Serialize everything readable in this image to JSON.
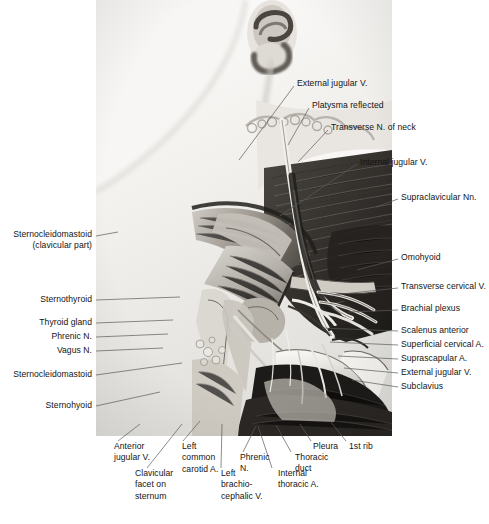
{
  "figure": {
    "image": {
      "name": "neck-dissection-photograph",
      "description": "Black and white anatomical dissection photograph of the left side of the neck and root of the neck, showing reflected platysma, sternocleidomastoid, omohyoid, brachial plexus, scalenus anterior and the structures behind the clavicle."
    },
    "labels_right": [
      {
        "id": "external-jugular-vein-upper",
        "text": "External jugular V.",
        "x": 297,
        "y": 78,
        "lead": [
          294,
          86,
          239,
          160
        ]
      },
      {
        "id": "platysma-reflected",
        "text": "Platysma reflected",
        "x": 312,
        "y": 100,
        "lead": [
          309,
          108,
          288,
          145
        ]
      },
      {
        "id": "transverse-nerve-of-neck",
        "text": "Transverse N. of neck",
        "x": 331,
        "y": 122,
        "lead": [
          328,
          130,
          298,
          162
        ]
      },
      {
        "id": "internal-jugular-vein",
        "text": "Internal jugular V.",
        "x": 360,
        "y": 157,
        "lead": [
          357,
          164,
          280,
          216
        ]
      },
      {
        "id": "supraclavicular-nerves",
        "text": "Supraclavicular Nn.",
        "x": 401,
        "y": 192,
        "lead": [
          398,
          199,
          376,
          207
        ]
      },
      {
        "id": "omohyoid",
        "text": "Omohyoid",
        "x": 401,
        "y": 252,
        "lead": [
          398,
          259,
          357,
          270
        ]
      },
      {
        "id": "transverse-cervical-vein",
        "text": "Transverse cervical V.",
        "x": 401,
        "y": 281,
        "lead": [
          398,
          288,
          333,
          295
        ]
      },
      {
        "id": "brachial-plexus",
        "text": "Brachial plexus",
        "x": 401,
        "y": 303,
        "lead": [
          398,
          310,
          348,
          312
        ]
      },
      {
        "id": "scalenus-anterior",
        "text": "Scalenus anterior",
        "x": 401,
        "y": 325,
        "lead": [
          398,
          331,
          322,
          328
        ]
      },
      {
        "id": "superficial-cervical-artery",
        "text": "Superficial cervical A.",
        "x": 401,
        "y": 339,
        "lead": [
          398,
          345,
          330,
          342
        ]
      },
      {
        "id": "suprascapular-artery",
        "text": "Suprascapular A.",
        "x": 401,
        "y": 353,
        "lead": [
          398,
          359,
          338,
          356
        ]
      },
      {
        "id": "external-jugular-vein-lower",
        "text": "External jugular V.",
        "x": 401,
        "y": 367,
        "lead": [
          398,
          373,
          344,
          368
        ]
      },
      {
        "id": "subclavius",
        "text": "Subclavius",
        "x": 401,
        "y": 381,
        "lead": [
          398,
          387,
          352,
          380
        ]
      }
    ],
    "labels_left": [
      {
        "id": "sternocleidomastoid-clavicular-part",
        "text": "Sternocleidomastoid\n(clavicular part)",
        "x": 92,
        "y": 229,
        "align": "right",
        "lead": [
          96,
          236,
          118,
          232
        ]
      },
      {
        "id": "sternothyroid",
        "text": "Sternothyroid",
        "x": 92,
        "y": 294,
        "align": "right",
        "lead": [
          96,
          300,
          180,
          297
        ]
      },
      {
        "id": "thyroid-gland",
        "text": "Thyroid gland",
        "x": 92,
        "y": 317,
        "align": "right",
        "lead": [
          96,
          323,
          173,
          320
        ]
      },
      {
        "id": "phrenic-nerve-left",
        "text": "Phrenic N.",
        "x": 92,
        "y": 331,
        "align": "right",
        "lead": [
          96,
          337,
          168,
          334
        ]
      },
      {
        "id": "vagus-nerve",
        "text": "Vagus N.",
        "x": 92,
        "y": 345,
        "align": "right",
        "lead": [
          96,
          351,
          163,
          348
        ]
      },
      {
        "id": "sternocleidomastoid",
        "text": "Sternocleidomastoid",
        "x": 92,
        "y": 369,
        "align": "right",
        "lead": [
          96,
          375,
          182,
          363
        ]
      },
      {
        "id": "sternohyoid",
        "text": "Sternohyoid",
        "x": 92,
        "y": 400,
        "align": "right",
        "lead": [
          96,
          406,
          160,
          392
        ]
      }
    ],
    "labels_bottom": [
      {
        "id": "anterior-jugular-vein",
        "text": "Anterior\njugular V.",
        "cx": 114,
        "y": 441,
        "lead": [
          118,
          441,
          140,
          424
        ]
      },
      {
        "id": "left-common-carotid-artery",
        "text": "Left\ncommon\ncarotid A.",
        "cx": 182,
        "y": 441,
        "lead": [
          183,
          441,
          200,
          421
        ]
      },
      {
        "id": "phrenic-nerve-bottom",
        "text": "Phrenic\nN.",
        "cx": 240,
        "y": 452,
        "lead": [
          243,
          452,
          256,
          426
        ]
      },
      {
        "id": "thoracic-duct",
        "text": "Thoracic\nduct",
        "cx": 295,
        "y": 452,
        "lead": [
          291,
          452,
          276,
          425
        ]
      },
      {
        "id": "pleura",
        "text": "Pleura",
        "cx": 313,
        "y": 441,
        "lead": [
          311,
          441,
          300,
          424
        ]
      },
      {
        "id": "first-rib",
        "text": "1st rib",
        "cx": 349,
        "y": 441,
        "lead": [
          346,
          441,
          330,
          421
        ]
      },
      {
        "id": "clavicular-facet-on-sternum",
        "text": "Clavicular\nfacet on\nsternum",
        "cx": 135,
        "y": 468,
        "lead": [
          147,
          468,
          182,
          424
        ]
      },
      {
        "id": "left-brachiocephalic-vein",
        "text": "Left\nbrachio-\ncephalic V.",
        "cx": 221,
        "y": 468,
        "lead": [
          221,
          468,
          222,
          424
        ]
      },
      {
        "id": "internal-thoracic-artery",
        "text": "Internal\nthoracic A.",
        "cx": 278,
        "y": 468,
        "lead": [
          272,
          468,
          258,
          426
        ]
      }
    ]
  },
  "colors": {
    "text": "#141414",
    "leader": "#5a5a5a",
    "page_background": "#ffffff"
  }
}
